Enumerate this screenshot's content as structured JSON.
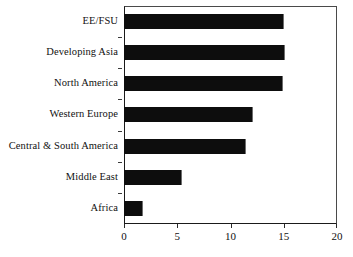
{
  "chart_data": {
    "type": "bar",
    "orientation": "horizontal",
    "title": "",
    "subtitle": "",
    "xlabel": "",
    "ylabel": "",
    "categories": [
      "EE/FSU",
      "Developing Asia",
      "North America",
      "Western Europe",
      "Central & South America",
      "Middle East",
      "Africa"
    ],
    "values": [
      15.0,
      15.1,
      14.9,
      12.1,
      11.5,
      5.4,
      1.8
    ],
    "xlim": [
      0,
      20
    ],
    "xticks": [
      0,
      5,
      10,
      15,
      20
    ],
    "xticklabels": [
      "0",
      "5",
      "10",
      "15",
      "20"
    ],
    "grid": false,
    "legend": null,
    "bar_color": "#0d0d0d",
    "frame_color": "#4a4a4a",
    "background_color": "#ffffff"
  }
}
